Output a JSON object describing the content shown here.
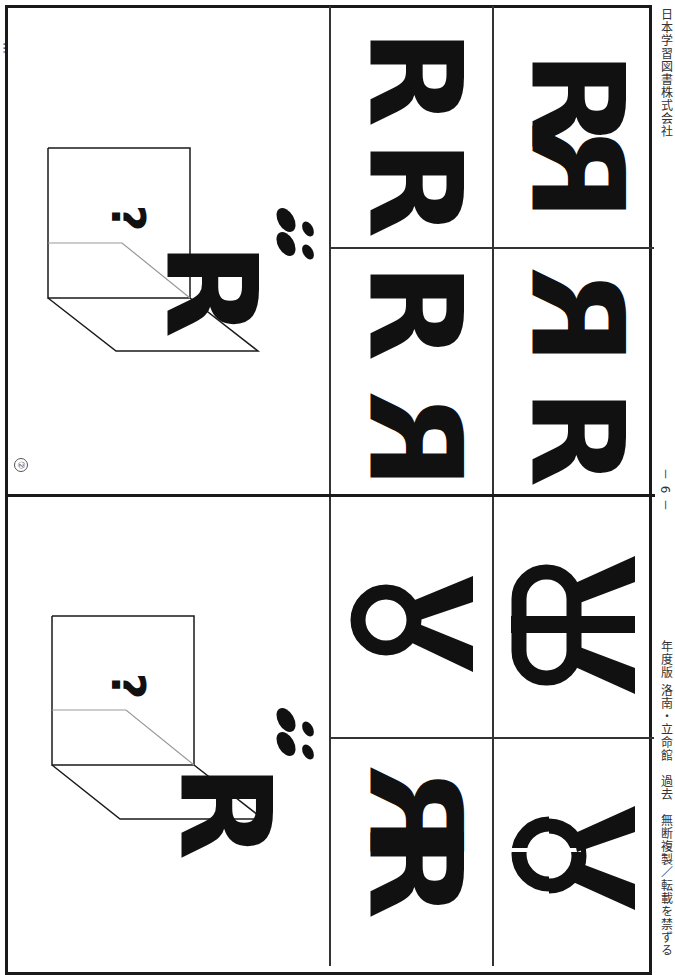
{
  "page": {
    "orientation": "rotated-90",
    "header_partial_text": "…",
    "footer_left": "年度版 洛南・立命館　過去　無断複製／転載を禁ずる",
    "page_number": "－ 6 －",
    "publisher": "日本学習図書株式会社",
    "question_marker": "②"
  },
  "problems": [
    {
      "id": "upper",
      "marker": "②",
      "stimulus": {
        "letter": "R",
        "mystery_symbol": "?",
        "footprints_icon": "footprints"
      },
      "choices": [
        {
          "index": 1,
          "glyphs": "R R"
        },
        {
          "index": 2,
          "glyphs": "ЯR (reflected pair)"
        },
        {
          "index": 3,
          "glyphs": "Я R"
        },
        {
          "index": 4,
          "glyphs": "R Я"
        }
      ]
    },
    {
      "id": "lower",
      "stimulus": {
        "letter": "R",
        "mystery_symbol": "?",
        "footprints_icon": "footprints"
      },
      "choices": [
        {
          "index": 1,
          "glyphs": "circle-with-legs"
        },
        {
          "index": 2,
          "glyphs": "oval-with-bar-and-legs"
        },
        {
          "index": 3,
          "glyphs": "R+Я overlap"
        },
        {
          "index": 4,
          "glyphs": "split-circle-with-legs"
        }
      ]
    }
  ],
  "colors": {
    "ink": "#111111",
    "line": "#1a1a1a",
    "mirror_line": "#999999"
  }
}
